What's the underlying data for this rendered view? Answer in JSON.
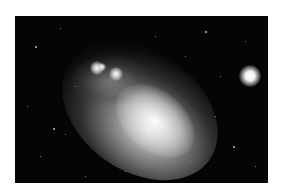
{
  "image": {
    "subject": "dwarf galaxy in star field",
    "description": "Grayscale astronomical photograph of an irregular dwarf galaxy with a bright foreground star on the right",
    "background_color": "#ffffff",
    "frame": {
      "left": 15,
      "top": 16,
      "width": 253,
      "height": 167
    },
    "sky_color": "#050505",
    "bright_star": {
      "x": 250,
      "y": 75
    }
  }
}
